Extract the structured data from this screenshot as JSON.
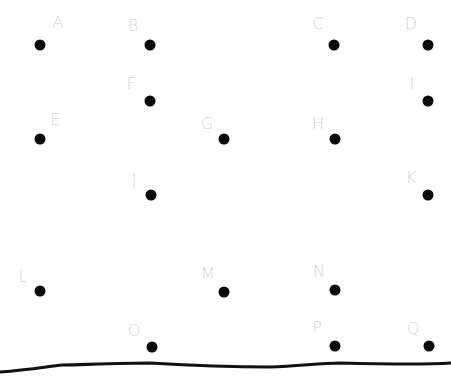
{
  "diagram": {
    "type": "point-grid",
    "colors": {
      "dot": "#0a0a0a",
      "label": "#d4d4d4",
      "line": "#111111",
      "background": "#ffffff"
    },
    "points": [
      {
        "label": "A",
        "x": 40,
        "y": 45,
        "lx": 58,
        "ly": 23
      },
      {
        "label": "B",
        "x": 150,
        "y": 45,
        "lx": 133,
        "ly": 26
      },
      {
        "label": "C",
        "x": 334,
        "y": 45,
        "lx": 318,
        "ly": 24
      },
      {
        "label": "D",
        "x": 428,
        "y": 45,
        "lx": 411,
        "ly": 24
      },
      {
        "label": "E",
        "x": 40,
        "y": 139,
        "lx": 55,
        "ly": 120
      },
      {
        "label": "F",
        "x": 150,
        "y": 101,
        "lx": 131,
        "ly": 84
      },
      {
        "label": "G",
        "x": 224,
        "y": 139,
        "lx": 207,
        "ly": 124
      },
      {
        "label": "H",
        "x": 335,
        "y": 139,
        "lx": 318,
        "ly": 124
      },
      {
        "label": "I",
        "x": 428,
        "y": 101,
        "lx": 412,
        "ly": 84
      },
      {
        "label": "J",
        "x": 151,
        "y": 195,
        "lx": 134,
        "ly": 180
      },
      {
        "label": "K",
        "x": 428,
        "y": 195,
        "lx": 411,
        "ly": 178
      },
      {
        "label": "L",
        "x": 40,
        "y": 291,
        "lx": 23,
        "ly": 277
      },
      {
        "label": "M",
        "x": 224,
        "y": 292,
        "lx": 208,
        "ly": 274
      },
      {
        "label": "N",
        "x": 335,
        "y": 290,
        "lx": 319,
        "ly": 272
      },
      {
        "label": "O",
        "x": 152,
        "y": 347,
        "lx": 134,
        "ly": 331
      },
      {
        "label": "P",
        "x": 335,
        "y": 346,
        "lx": 317,
        "ly": 328
      },
      {
        "label": "Q",
        "x": 429,
        "y": 346,
        "lx": 413,
        "ly": 329
      }
    ],
    "ground_line": "M0,372 C30,370 50,366 62,365 C100,364 130,363 150,363 C200,366 240,367 270,367 C300,366 320,363 340,363 C380,364 420,365 451,363"
  }
}
